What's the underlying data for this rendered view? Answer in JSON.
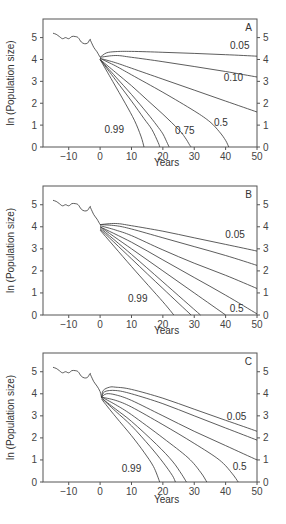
{
  "chart_data": [
    {
      "type": "line",
      "panel_label": "A",
      "xlabel": "Years",
      "ylabel": "ln (Population size)",
      "xlim": [
        -18.2,
        50
      ],
      "ylim": [
        0,
        5.85
      ],
      "xticks": [
        -10,
        0,
        10,
        20,
        30,
        40,
        50
      ],
      "yticks": [
        0,
        1,
        2,
        3,
        4,
        5
      ],
      "grid": false,
      "historical": {
        "x": [
          -15,
          -14,
          -13,
          -12,
          -11,
          -10,
          -9,
          -8,
          -7,
          -6,
          -5,
          -4,
          -3.2,
          -3,
          -2,
          -1,
          0
        ],
        "y": [
          5.2,
          5.15,
          5.05,
          4.95,
          5.0,
          4.95,
          5.05,
          5.05,
          5.0,
          4.8,
          4.72,
          4.75,
          4.92,
          4.85,
          4.55,
          4.35,
          4.1
        ]
      },
      "series": [
        {
          "name": "0.05",
          "x": [
            0,
            2,
            5,
            10,
            20,
            30,
            40,
            50
          ],
          "y": [
            4.1,
            4.3,
            4.36,
            4.37,
            4.33,
            4.28,
            4.22,
            4.15
          ]
        },
        {
          "name": "0.10",
          "x": [
            0,
            5,
            10,
            20,
            30,
            40,
            50
          ],
          "y": [
            4.1,
            4.18,
            4.1,
            3.9,
            3.68,
            3.45,
            3.2
          ]
        },
        {
          "name": "0.25",
          "x": [
            0,
            5,
            10,
            20,
            30,
            40,
            50
          ],
          "y": [
            4.05,
            3.85,
            3.6,
            3.1,
            2.6,
            2.1,
            1.6
          ]
        },
        {
          "name": "0.5",
          "x": [
            0,
            5,
            10,
            20,
            30,
            35,
            38,
            40,
            41
          ],
          "y": [
            4.05,
            3.7,
            3.3,
            2.5,
            1.65,
            1.15,
            0.7,
            0.3,
            0
          ]
        },
        {
          "name": "0.75",
          "x": [
            0,
            5,
            10,
            15,
            20,
            25,
            27,
            28.5,
            29
          ],
          "y": [
            4.0,
            3.4,
            2.8,
            2.15,
            1.5,
            0.8,
            0.45,
            0.1,
            0
          ]
        },
        {
          "name": "0.85",
          "x": [
            0,
            5,
            10,
            15,
            18,
            20,
            21.5,
            22
          ],
          "y": [
            4.0,
            3.2,
            2.4,
            1.55,
            1.0,
            0.6,
            0.15,
            0
          ]
        },
        {
          "name": "0.95",
          "x": [
            0,
            5,
            10,
            14,
            16.5,
            18.5,
            19
          ],
          "y": [
            4.0,
            3.05,
            2.1,
            1.3,
            0.8,
            0.2,
            0
          ]
        },
        {
          "name": "0.99",
          "x": [
            0,
            4,
            8,
            11,
            13,
            14
          ],
          "y": [
            4.0,
            3.0,
            2.0,
            1.2,
            0.5,
            0
          ]
        }
      ],
      "annotations": [
        {
          "text": "0.05",
          "x": 44.5,
          "y": 4.48
        },
        {
          "text": "0.10",
          "x": 42.5,
          "y": 3.0
        },
        {
          "text": "0.5",
          "x": 38.5,
          "y": 0.95
        },
        {
          "text": "0.75",
          "x": 27,
          "y": 0.6
        },
        {
          "text": "0.99",
          "x": 4.5,
          "y": 0.65
        }
      ]
    },
    {
      "type": "line",
      "panel_label": "B",
      "xlabel": "Years",
      "ylabel": "ln (Population size)",
      "xlim": [
        -18.2,
        50
      ],
      "ylim": [
        0,
        5.85
      ],
      "xticks": [
        -10,
        0,
        10,
        20,
        30,
        40,
        50
      ],
      "yticks": [
        0,
        1,
        2,
        3,
        4,
        5
      ],
      "grid": false,
      "historical": {
        "x": [
          -15,
          -14,
          -13,
          -12,
          -11,
          -10,
          -9,
          -8,
          -7,
          -6,
          -5,
          -4,
          -3.2,
          -3,
          -2,
          -1,
          0
        ],
        "y": [
          5.2,
          5.15,
          5.05,
          4.95,
          5.0,
          4.95,
          5.05,
          5.05,
          5.0,
          4.8,
          4.72,
          4.75,
          4.92,
          4.85,
          4.55,
          4.35,
          4.1
        ]
      },
      "series": [
        {
          "name": "0.05",
          "x": [
            0,
            5,
            10,
            20,
            30,
            40,
            50
          ],
          "y": [
            4.1,
            4.15,
            4.05,
            3.8,
            3.5,
            3.2,
            2.9
          ]
        },
        {
          "name": "0.10",
          "x": [
            0,
            5,
            10,
            20,
            30,
            40,
            50
          ],
          "y": [
            4.1,
            4.05,
            3.9,
            3.5,
            3.1,
            2.7,
            2.25
          ]
        },
        {
          "name": "0.25",
          "x": [
            0,
            5,
            10,
            20,
            30,
            40,
            50
          ],
          "y": [
            4.05,
            3.85,
            3.6,
            2.95,
            2.35,
            1.8,
            1.2
          ]
        },
        {
          "name": "0.5",
          "x": [
            0,
            10,
            20,
            30,
            40,
            50
          ],
          "y": [
            4.0,
            3.3,
            2.5,
            1.7,
            0.9,
            0.05
          ]
        },
        {
          "name": "0.75",
          "x": [
            0,
            10,
            20,
            30,
            40
          ],
          "y": [
            4.0,
            3.0,
            2.0,
            1.0,
            0
          ]
        },
        {
          "name": "0.85",
          "x": [
            0,
            10,
            20,
            32
          ],
          "y": [
            3.95,
            2.75,
            1.5,
            0
          ]
        },
        {
          "name": "0.95",
          "x": [
            0,
            10,
            20,
            29
          ],
          "y": [
            3.9,
            2.55,
            1.2,
            0
          ]
        },
        {
          "name": "0.99",
          "x": [
            0,
            10,
            20,
            23.5
          ],
          "y": [
            3.85,
            2.2,
            0.6,
            0
          ]
        }
      ],
      "annotations": [
        {
          "text": "0.05",
          "x": 43,
          "y": 3.48
        },
        {
          "text": "0.99",
          "x": 12,
          "y": 0.6
        },
        {
          "text": "0.5",
          "x": 43.5,
          "y": 0.15
        }
      ]
    },
    {
      "type": "line",
      "panel_label": "C",
      "xlabel": "Years",
      "ylabel": "ln (Population size)",
      "xlim": [
        -18.2,
        50
      ],
      "ylim": [
        0,
        5.85
      ],
      "xticks": [
        -10,
        0,
        10,
        20,
        30,
        40,
        50
      ],
      "yticks": [
        0,
        1,
        2,
        3,
        4,
        5
      ],
      "grid": false,
      "historical": {
        "x": [
          -15,
          -14,
          -13,
          -12,
          -11,
          -10,
          -9,
          -8,
          -7,
          -6,
          -5,
          -4,
          -3.2,
          -3,
          -2,
          -1,
          0,
          0.5
        ],
        "y": [
          5.2,
          5.15,
          5.05,
          4.95,
          5.0,
          4.95,
          5.05,
          5.05,
          5.0,
          4.8,
          4.72,
          4.75,
          4.92,
          4.85,
          4.55,
          4.35,
          4.1,
          3.8
        ]
      },
      "series": [
        {
          "name": "0.05",
          "x": [
            0.5,
            1,
            3,
            5,
            10,
            20,
            30,
            40,
            50
          ],
          "y": [
            3.85,
            4.15,
            4.3,
            4.3,
            4.2,
            3.8,
            3.3,
            2.8,
            2.3
          ]
        },
        {
          "name": "0.10",
          "x": [
            0.5,
            1.5,
            5,
            10,
            20,
            30,
            40,
            50
          ],
          "y": [
            3.85,
            4.1,
            4.15,
            4.0,
            3.55,
            3.0,
            2.45,
            1.9
          ]
        },
        {
          "name": "0.25",
          "x": [
            0.5,
            2,
            5,
            10,
            20,
            30,
            40,
            50
          ],
          "y": [
            3.85,
            4.0,
            3.95,
            3.7,
            3.0,
            2.3,
            1.65,
            1.0
          ]
        },
        {
          "name": "0.5",
          "x": [
            0.5,
            5,
            10,
            20,
            30,
            38,
            42,
            44
          ],
          "y": [
            3.85,
            3.7,
            3.4,
            2.6,
            1.75,
            1.0,
            0.4,
            0
          ]
        },
        {
          "name": "0.75",
          "x": [
            0.5,
            5,
            10,
            20,
            28,
            32,
            34
          ],
          "y": [
            3.85,
            3.5,
            3.05,
            2.0,
            1.1,
            0.45,
            0
          ]
        },
        {
          "name": "0.85",
          "x": [
            0.5,
            5,
            10,
            18,
            23,
            26,
            27.5
          ],
          "y": [
            3.8,
            3.3,
            2.75,
            1.7,
            0.95,
            0.35,
            0
          ]
        },
        {
          "name": "0.95",
          "x": [
            0.5,
            5,
            10,
            16,
            20,
            23,
            24
          ],
          "y": [
            3.8,
            3.2,
            2.55,
            1.6,
            0.9,
            0.3,
            0
          ]
        },
        {
          "name": "0.99",
          "x": [
            0.5,
            5,
            10,
            14,
            17,
            19
          ],
          "y": [
            3.75,
            2.95,
            2.1,
            1.35,
            0.7,
            0
          ]
        }
      ],
      "annotations": [
        {
          "text": "0.05",
          "x": 43.5,
          "y": 2.8
        },
        {
          "text": "0.99",
          "x": 10,
          "y": 0.45
        },
        {
          "text": "0.5",
          "x": 44.5,
          "y": 0.55
        }
      ]
    }
  ],
  "panels_layout": [
    {
      "top": 19,
      "bottom": 147,
      "title_y": 166
    },
    {
      "top": 186,
      "bottom": 315,
      "title_y": 334
    },
    {
      "top": 353,
      "bottom": 482,
      "title_y": 503
    }
  ],
  "plot_left": 43,
  "plot_right": 257,
  "line_color": "#333333",
  "axis_color": "#555555"
}
